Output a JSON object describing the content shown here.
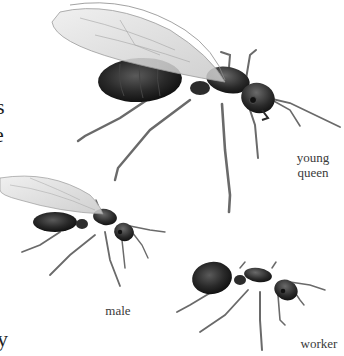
{
  "figure": {
    "subjects": [
      {
        "id": "young-queen",
        "label_lines": [
          "young",
          "queen"
        ]
      },
      {
        "id": "male",
        "label_lines": [
          "male"
        ]
      },
      {
        "id": "worker",
        "label_lines": [
          "worker"
        ]
      }
    ]
  },
  "cropped_text_fragments": [
    "s",
    "e",
    "y"
  ],
  "colors": {
    "background": "#ffffff",
    "body_dark": "#222222",
    "wing": "#d9d9d9",
    "leg": "#6a6a6a",
    "text": "#3a3a3a"
  }
}
